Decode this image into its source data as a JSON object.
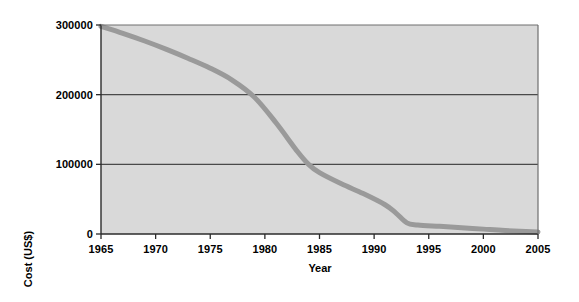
{
  "chart_data": {
    "type": "line",
    "title": "",
    "xlabel": "Year",
    "ylabel": "Cost (US$)",
    "xlim": [
      1965,
      2005
    ],
    "ylim": [
      0,
      300000
    ],
    "xticks": [
      1965,
      1970,
      1975,
      1980,
      1985,
      1990,
      1995,
      2000,
      2005
    ],
    "xtick_labels": [
      "1965",
      "1970",
      "1975",
      "1980",
      "1985",
      "1990",
      "1995",
      "2000",
      "2005"
    ],
    "yticks": [
      0,
      100000,
      200000,
      300000
    ],
    "ytick_labels": [
      "0",
      "100000",
      "200000",
      "300000"
    ],
    "grid": "horizontal gridlines at 100000 and 200000",
    "legend": null,
    "plot_background": "#d9d9d9",
    "line_color": "#9a9a9a",
    "line_width": 5,
    "series": [
      {
        "name": "Cost (US$)",
        "x": [
          1965,
          1967,
          1969,
          1971,
          1973,
          1975,
          1977,
          1979,
          1981,
          1983,
          1984,
          1985,
          1987,
          1989,
          1991,
          1992,
          1993,
          1994,
          1996,
          1998,
          2000,
          2002,
          2005
        ],
        "values": [
          298000,
          288000,
          277000,
          265000,
          252000,
          238000,
          221000,
          197000,
          160000,
          118000,
          100000,
          88000,
          72000,
          58000,
          42000,
          30000,
          16000,
          13000,
          11000,
          9000,
          7000,
          5000,
          3000
        ]
      }
    ]
  },
  "axes": {
    "x_label": "Year",
    "y_label": "Cost (US$)"
  }
}
